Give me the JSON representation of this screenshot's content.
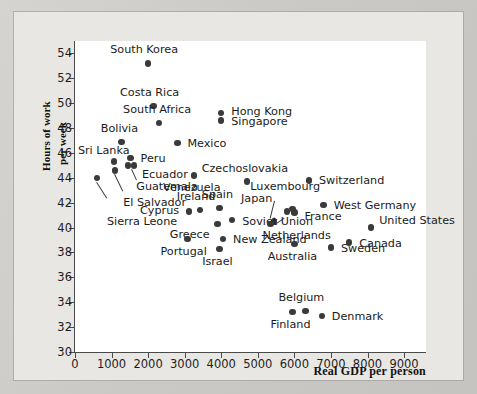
{
  "chart_data": {
    "type": "scatter",
    "title": "",
    "xlabel": "Real GDP per person",
    "ylabel_line1": "Hours of work",
    "ylabel_line2": "per week",
    "xlim": [
      0,
      9600
    ],
    "ylim": [
      30,
      55
    ],
    "xticks": [
      0,
      1000,
      2000,
      3000,
      4000,
      5000,
      6000,
      7000,
      8000,
      9000
    ],
    "xticklabels": [
      "0",
      "1000",
      "2000",
      "3000",
      "4000",
      "5000",
      "6000",
      "7000",
      "8000",
      "9000"
    ],
    "yticks": [
      30,
      32,
      34,
      36,
      38,
      40,
      42,
      44,
      46,
      48,
      50,
      52,
      54
    ],
    "yticklabels": [
      "30",
      "32",
      "34",
      "36",
      "38",
      "40",
      "42",
      "44",
      "46",
      "48",
      "50",
      "52",
      "54"
    ],
    "grid": false,
    "legend": "none",
    "marker_color": "#3a3a3a",
    "points": [
      {
        "name": "South Korea",
        "x": 2000,
        "y": 53.2,
        "label_dx": -4,
        "label_dy": -13,
        "anchor": "mid"
      },
      {
        "name": "Costa Rica",
        "x": 2150,
        "y": 49.8,
        "label_dx": -4,
        "label_dy": -13,
        "anchor": "mid"
      },
      {
        "name": "Hong Kong",
        "x": 4000,
        "y": 49.2,
        "label_dx": 10,
        "label_dy": -1,
        "anchor": "left"
      },
      {
        "name": "Singapore",
        "x": 4000,
        "y": 48.6,
        "label_dx": 10,
        "label_dy": 1,
        "anchor": "left"
      },
      {
        "name": "South Africa",
        "x": 2300,
        "y": 48.4,
        "label_dx": -2,
        "label_dy": -13,
        "anchor": "mid"
      },
      {
        "name": "Mexico",
        "x": 2800,
        "y": 46.8,
        "label_dx": 10,
        "label_dy": 1,
        "anchor": "left"
      },
      {
        "name": "Bolivia",
        "x": 1270,
        "y": 46.9,
        "label_dx": -2,
        "label_dy": -13,
        "anchor": "mid"
      },
      {
        "name": "Peru",
        "x": 1520,
        "y": 45.6,
        "label_dx": 10,
        "label_dy": 1,
        "anchor": "left"
      },
      {
        "name": "Sri Lanka",
        "x": 1060,
        "y": 45.3,
        "label_dx": -10,
        "label_dy": -11,
        "anchor": "mid"
      },
      {
        "name": "Ecuador",
        "x": 1450,
        "y": 45.0,
        "label_dx": 14,
        "label_dy": 10,
        "anchor": "left"
      },
      {
        "name": "Guatemala",
        "x": 1620,
        "y": 45.0,
        "label_dx": 2,
        "label_dy": 22,
        "anchor": "left"
      },
      {
        "name": "El Salvador",
        "x": 1100,
        "y": 44.6,
        "label_dx": 8,
        "label_dy": 33,
        "anchor": "left"
      },
      {
        "name": "Sierra Leone",
        "x": 600,
        "y": 44.0,
        "label_dx": 10,
        "label_dy": 44,
        "anchor": "left"
      },
      {
        "name": "Venezuela",
        "x": 3250,
        "y": 44.2,
        "label_dx": -2,
        "label_dy": 13,
        "anchor": "mid"
      },
      {
        "name": "Czechoslovakia",
        "x": 4700,
        "y": 43.7,
        "label_dx": -2,
        "label_dy": -13,
        "anchor": "mid"
      },
      {
        "name": "Switzerland",
        "x": 6400,
        "y": 43.8,
        "label_dx": 10,
        "label_dy": 1,
        "anchor": "left"
      },
      {
        "name": "Luxembourg",
        "x": 5450,
        "y": 40.5,
        "label_dx": -24,
        "label_dy": -34,
        "anchor": "left"
      },
      {
        "name": "Japan",
        "x": 5800,
        "y": 41.3,
        "label_dx": -46,
        "label_dy": -12,
        "anchor": "left"
      },
      {
        "name": "Japan2",
        "x": 5950,
        "y": 41.5,
        "label_dx": 0,
        "label_dy": 0,
        "anchor": "none"
      },
      {
        "name": "West Germany",
        "x": 6800,
        "y": 41.8,
        "label_dx": 10,
        "label_dy": 1,
        "anchor": "left"
      },
      {
        "name": "France",
        "x": 6000,
        "y": 41.2,
        "label_dx": 10,
        "label_dy": 4,
        "anchor": "left"
      },
      {
        "name": "United States",
        "x": 8100,
        "y": 40.0,
        "label_dx": 8,
        "label_dy": -7,
        "anchor": "left"
      },
      {
        "name": "Ireland",
        "x": 3420,
        "y": 41.4,
        "label_dx": -4,
        "label_dy": -13,
        "anchor": "mid"
      },
      {
        "name": "Spain",
        "x": 3950,
        "y": 41.6,
        "label_dx": -2,
        "label_dy": -13,
        "anchor": "mid"
      },
      {
        "name": "Cyprus",
        "x": 3120,
        "y": 41.3,
        "label_dx": -10,
        "label_dy": 0,
        "anchor": "right"
      },
      {
        "name": "Soviet Union",
        "x": 4300,
        "y": 40.6,
        "label_dx": 10,
        "label_dy": 2,
        "anchor": "left"
      },
      {
        "name": "Greece",
        "x": 3900,
        "y": 40.3,
        "label_dx": -8,
        "label_dy": 11,
        "anchor": "right"
      },
      {
        "name": "Netherlands",
        "x": 5350,
        "y": 40.3,
        "label_dx": -8,
        "label_dy": 12,
        "anchor": "left"
      },
      {
        "name": "New Zealand",
        "x": 4050,
        "y": 39.1,
        "label_dx": 10,
        "label_dy": 1,
        "anchor": "left"
      },
      {
        "name": "Portugal",
        "x": 3080,
        "y": 39.1,
        "label_dx": -4,
        "label_dy": 13,
        "anchor": "mid"
      },
      {
        "name": "Israel",
        "x": 3950,
        "y": 38.3,
        "label_dx": -2,
        "label_dy": 13,
        "anchor": "mid"
      },
      {
        "name": "Australia",
        "x": 6000,
        "y": 38.7,
        "label_dx": -2,
        "label_dy": 13,
        "anchor": "mid"
      },
      {
        "name": "Canada",
        "x": 7500,
        "y": 38.8,
        "label_dx": 10,
        "label_dy": 1,
        "anchor": "left"
      },
      {
        "name": "Sweden",
        "x": 7000,
        "y": 38.4,
        "label_dx": 10,
        "label_dy": 1,
        "anchor": "left"
      },
      {
        "name": "Belgium",
        "x": 6300,
        "y": 33.3,
        "label_dx": -4,
        "label_dy": -13,
        "anchor": "mid"
      },
      {
        "name": "Finland",
        "x": 5950,
        "y": 33.2,
        "label_dx": -2,
        "label_dy": 13,
        "anchor": "mid"
      },
      {
        "name": "Denmark",
        "x": 6750,
        "y": 32.9,
        "label_dx": 10,
        "label_dy": 1,
        "anchor": "left"
      }
    ],
    "leaders": [
      {
        "name": "sierra-leone-leader",
        "x1": 600,
        "y1": 43.7,
        "x2": 880,
        "y2": 42.4
      },
      {
        "name": "el-salvador-leader",
        "x1": 1100,
        "y1": 44.3,
        "x2": 1330,
        "y2": 42.9
      },
      {
        "name": "guatemala-leader",
        "x1": 1560,
        "y1": 44.7,
        "x2": 1700,
        "y2": 43.8
      },
      {
        "name": "luxembourg-leader",
        "x1": 5480,
        "y1": 42.1,
        "x2": 5360,
        "y2": 40.7
      },
      {
        "name": "japan-leader",
        "x1": 5480,
        "y1": 40.3,
        "x2": 5720,
        "y2": 40.8
      }
    ]
  }
}
